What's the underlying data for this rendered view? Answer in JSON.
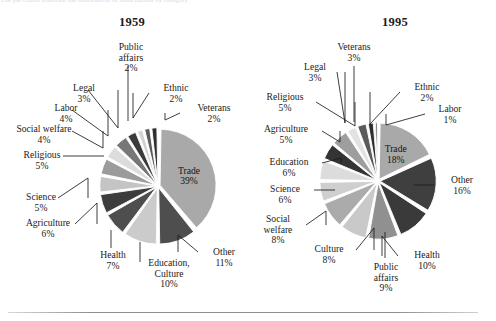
{
  "page": {
    "cropped_caption_fragment": "The pie charts illustrate the distribution of associations by category",
    "background_color": "#ffffff",
    "rule_color": "#8d8d8d"
  },
  "charts": [
    {
      "id": "1959",
      "title": "1959",
      "type": "pie",
      "exploded": true,
      "center": {
        "x": 158,
        "y": 186
      },
      "radius": 56,
      "start_angle_deg": -90,
      "slices": [
        {
          "label": "Trade",
          "value": 39,
          "pct_text": "39%",
          "color": "#a9a9a9",
          "inside": true
        },
        {
          "label": "Other",
          "value": 11,
          "pct_text": "11%",
          "color": "#4e4e4e",
          "inside": false
        },
        {
          "label": "Education,\nCulture",
          "value": 10,
          "pct_text": "10%",
          "color": "#cbcbcb",
          "inside": false
        },
        {
          "label": "Health",
          "value": 7,
          "pct_text": "7%",
          "color": "#4e4e4e",
          "inside": false
        },
        {
          "label": "Agriculture",
          "value": 6,
          "pct_text": "6%",
          "color": "#3d3d3d",
          "inside": false
        },
        {
          "label": "Science",
          "value": 5,
          "pct_text": "5%",
          "color": "#c4c4c4",
          "inside": false
        },
        {
          "label": "Religious",
          "value": 5,
          "pct_text": "5%",
          "color": "#9b9b9b",
          "inside": false
        },
        {
          "label": "Social welfare",
          "value": 4,
          "pct_text": "4%",
          "color": "#dcdcdc",
          "inside": false
        },
        {
          "label": "Labor",
          "value": 4,
          "pct_text": "4%",
          "color": "#777777",
          "inside": false
        },
        {
          "label": "Legal",
          "value": 3,
          "pct_text": "3%",
          "color": "#3a3a3a",
          "inside": false
        },
        {
          "label": "Public\naffairs",
          "value": 2,
          "pct_text": "2%",
          "color": "#d2d2d2",
          "inside": false
        },
        {
          "label": "Ethnic",
          "value": 2,
          "pct_text": "2%",
          "color": "#5a5a5a",
          "inside": false
        },
        {
          "label": "Veterans",
          "value": 2,
          "pct_text": "2%",
          "color": "#2e2e2e",
          "inside": false
        }
      ],
      "labels": [
        {
          "key": "public-affairs",
          "text": "Public\naffairs\n2%",
          "x": 101,
          "y": 42,
          "w": 60
        },
        {
          "key": "ethnic",
          "text": "Ethnic\n2%",
          "x": 152,
          "y": 83,
          "w": 48
        },
        {
          "key": "veterans",
          "text": "Veterans\n2%",
          "x": 186,
          "y": 103,
          "w": 56
        },
        {
          "key": "legal",
          "text": "Legal\n3%",
          "x": 62,
          "y": 83,
          "w": 44
        },
        {
          "key": "labor",
          "text": "Labor\n4%",
          "x": 44,
          "y": 103,
          "w": 44
        },
        {
          "key": "social-welfare",
          "text": "Social welfare\n4%",
          "x": 3,
          "y": 124,
          "w": 82
        },
        {
          "key": "religious",
          "text": "Religious\n5%",
          "x": 13,
          "y": 150,
          "w": 58
        },
        {
          "key": "science",
          "text": "Science\n5%",
          "x": 14,
          "y": 192,
          "w": 54
        },
        {
          "key": "agriculture",
          "text": "Agriculture\n6%",
          "x": 14,
          "y": 218,
          "w": 68
        },
        {
          "key": "health",
          "text": "Health\n7%",
          "x": 91,
          "y": 250,
          "w": 44
        },
        {
          "key": "education",
          "text": "Education,\nCulture\n10%",
          "x": 138,
          "y": 258,
          "w": 62
        },
        {
          "key": "other",
          "text": "Other\n11%",
          "x": 202,
          "y": 247,
          "w": 44
        }
      ],
      "leaders": [
        {
          "from": [
            128,
            66
          ],
          "to": [
            128,
            121
          ],
          "bend": null
        },
        {
          "from": [
            149,
            93
          ],
          "to": [
            133,
            93
          ],
          "bend": [
            133,
            118
          ]
        },
        {
          "from": [
            180,
            113
          ],
          "to": [
            165,
            113
          ],
          "bend": [
            165,
            120
          ]
        },
        {
          "from": [
            88,
            90
          ],
          "to": [
            118,
            90
          ],
          "bend": [
            118,
            128
          ]
        },
        {
          "from": [
            72,
            110
          ],
          "to": [
            108,
            110
          ],
          "bend": [
            108,
            136
          ]
        },
        {
          "from": [
            72,
            131
          ],
          "to": [
            103,
            131
          ],
          "bend": [
            103,
            148
          ]
        },
        {
          "from": [
            63,
            156
          ],
          "to": [
            104,
            156
          ],
          "bend": null
        },
        {
          "from": [
            58,
            198
          ],
          "to": [
            88,
            198
          ],
          "bend": [
            88,
            178
          ]
        },
        {
          "from": [
            75,
            224
          ],
          "to": [
            97,
            224
          ],
          "bend": [
            97,
            203
          ]
        },
        {
          "from": [
            111,
            248
          ],
          "to": [
            111,
            230
          ],
          "bend": null
        },
        {
          "from": [
            140,
            262
          ],
          "to": [
            140,
            242
          ],
          "bend": null
        },
        {
          "from": [
            198,
            252
          ],
          "to": [
            178,
            252
          ],
          "bend": [
            178,
            235
          ]
        }
      ]
    },
    {
      "id": "1995",
      "title": "1995",
      "type": "pie",
      "exploded": true,
      "center": {
        "x": 378,
        "y": 181
      },
      "radius": 56,
      "start_angle_deg": -90,
      "slices": [
        {
          "label": "Trade",
          "value": 18,
          "pct_text": "18%",
          "color": "#a9a9a9",
          "inside": true
        },
        {
          "label": "Other",
          "value": 16,
          "pct_text": "16%",
          "color": "#3f3f3f",
          "inside": false
        },
        {
          "label": "Health",
          "value": 10,
          "pct_text": "10%",
          "color": "#3a3a3a",
          "inside": false
        },
        {
          "label": "Public affairs",
          "value": 9,
          "pct_text": "9%",
          "color": "#909090",
          "inside": false
        },
        {
          "label": "Culture",
          "value": 8,
          "pct_text": "8%",
          "color": "#c9c9c9",
          "inside": false
        },
        {
          "label": "Social welfare",
          "value": 8,
          "pct_text": "8%",
          "color": "#ababab",
          "inside": false
        },
        {
          "label": "Science",
          "value": 6,
          "pct_text": "6%",
          "color": "#cfcfcf",
          "inside": false
        },
        {
          "label": "Education",
          "value": 6,
          "pct_text": "6%",
          "color": "#dcdcdc",
          "inside": false
        },
        {
          "label": "Agriculture",
          "value": 5,
          "pct_text": "5%",
          "color": "#343434",
          "inside": false
        },
        {
          "label": "Religious",
          "value": 5,
          "pct_text": "5%",
          "color": "#9e9e9e",
          "inside": false
        },
        {
          "label": "Legal",
          "value": 3,
          "pct_text": "3%",
          "color": "#e2e2e2",
          "inside": false
        },
        {
          "label": "Veterans",
          "value": 3,
          "pct_text": "3%",
          "color": "#5a5a5a",
          "inside": false
        },
        {
          "label": "Ethnic",
          "value": 2,
          "pct_text": "2%",
          "color": "#2f2f2f",
          "inside": false
        },
        {
          "label": "Labor",
          "value": 1,
          "pct_text": "1%",
          "color": "#1f1f1f",
          "inside": false
        }
      ],
      "labels": [
        {
          "key": "veterans",
          "text": "Veterans\n3%",
          "x": 325,
          "y": 42,
          "w": 58
        },
        {
          "key": "legal",
          "text": "Legal\n3%",
          "x": 293,
          "y": 62,
          "w": 44
        },
        {
          "key": "ethnic",
          "text": "Ethnic\n2%",
          "x": 403,
          "y": 82,
          "w": 48
        },
        {
          "key": "religious",
          "text": "Religious\n5%",
          "x": 256,
          "y": 92,
          "w": 58
        },
        {
          "key": "labor",
          "text": "Labor\n1%",
          "x": 428,
          "y": 104,
          "w": 44
        },
        {
          "key": "agriculture",
          "text": "Agriculture\n5%",
          "x": 252,
          "y": 124,
          "w": 68
        },
        {
          "key": "education",
          "text": "Education\n6%",
          "x": 258,
          "y": 157,
          "w": 62
        },
        {
          "key": "science",
          "text": "Science\n6%",
          "x": 258,
          "y": 184,
          "w": 54
        },
        {
          "key": "other",
          "text": "Other\n16%",
          "x": 438,
          "y": 175,
          "w": 48
        },
        {
          "key": "social-welfare",
          "text": "Social\nwelfare\n8%",
          "x": 252,
          "y": 214,
          "w": 52
        },
        {
          "key": "culture",
          "text": "Culture\n8%",
          "x": 305,
          "y": 244,
          "w": 48
        },
        {
          "key": "health",
          "text": "Health\n10%",
          "x": 402,
          "y": 250,
          "w": 50
        },
        {
          "key": "public-affairs",
          "text": "Public\naffairs\n9%",
          "x": 360,
          "y": 262,
          "w": 52
        }
      ],
      "leaders": [
        {
          "from": [
            354,
            66
          ],
          "to": [
            354,
            122
          ],
          "bend": null
        },
        {
          "from": [
            337,
            72
          ],
          "to": [
            345,
            72
          ],
          "bend": [
            345,
            123
          ]
        },
        {
          "from": [
            400,
            92
          ],
          "to": [
            370,
            92
          ],
          "bend": [
            370,
            124
          ]
        },
        {
          "from": [
            316,
            102
          ],
          "to": [
            355,
            102
          ],
          "bend": [
            355,
            126
          ]
        },
        {
          "from": [
            425,
            114
          ],
          "to": [
            386,
            114
          ],
          "bend": [
            386,
            125
          ]
        },
        {
          "from": [
            322,
            131
          ],
          "to": [
            340,
            131
          ],
          "bend": [
            340,
            142
          ]
        },
        {
          "from": [
            322,
            163
          ],
          "to": [
            341,
            163
          ],
          "bend": [
            341,
            158
          ]
        },
        {
          "from": [
            314,
            190
          ],
          "to": [
            335,
            190
          ],
          "bend": null
        },
        {
          "from": [
            434,
            185
          ],
          "to": [
            414,
            185
          ],
          "bend": null
        },
        {
          "from": [
            306,
            225
          ],
          "to": [
            326,
            225
          ],
          "bend": [
            326,
            211
          ]
        },
        {
          "from": [
            356,
            250
          ],
          "to": [
            374,
            250
          ],
          "bend": [
            374,
            228
          ]
        },
        {
          "from": [
            398,
            256
          ],
          "to": [
            382,
            256
          ],
          "bend": [
            382,
            236
          ]
        },
        {
          "from": [
            385,
            258
          ],
          "to": [
            385,
            232
          ],
          "bend": null
        }
      ]
    }
  ]
}
